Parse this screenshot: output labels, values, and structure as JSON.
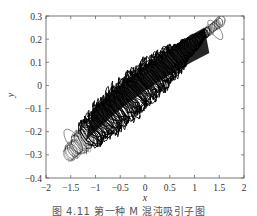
{
  "chart_data": {
    "type": "line",
    "title": "",
    "xlabel": "x",
    "ylabel": "y",
    "xlim": [
      -2,
      2
    ],
    "ylim": [
      -0.4,
      0.3
    ],
    "xticks": [
      -2,
      -1.5,
      -1,
      -0.5,
      0,
      0.5,
      1,
      1.5,
      2
    ],
    "xtick_labels": [
      "-2",
      "-1.5",
      "-1",
      "-0.5",
      "0",
      "0.5",
      "1",
      "1.5",
      "2"
    ],
    "yticks": [
      0.3,
      0.2,
      0.1,
      0,
      -0.1,
      -0.2,
      -0.3,
      -0.4
    ],
    "ytick_labels": [
      "0.3",
      "0.2",
      "0.1",
      "0",
      "-0.1",
      "-0.2",
      "-0.3",
      "-0.4"
    ],
    "grid": false,
    "legend": null,
    "band": {
      "start": {
        "x": -1.55,
        "y": -0.3
      },
      "end": {
        "x": 1.55,
        "y": 0.28
      },
      "thickness_y": 0.17
    },
    "series": [
      {
        "name": "trajectory",
        "color": "#000000"
      }
    ]
  },
  "caption": "图 4.11  第一种 M 混沌吸引子图"
}
